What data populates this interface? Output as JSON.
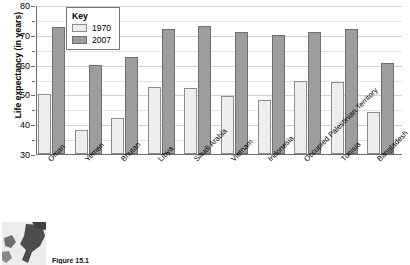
{
  "chart_data": {
    "type": "bar",
    "title": "",
    "xlabel": "",
    "ylabel": "Life expectancy (in years)",
    "ylim": [
      30,
      80
    ],
    "ytick_labels": [
      "30",
      "40",
      "50",
      "60",
      "70",
      "80"
    ],
    "yticks": [
      30,
      40,
      50,
      60,
      70,
      80
    ],
    "minor_ticks": [
      35,
      45,
      55,
      65,
      75
    ],
    "grid": true,
    "legend_position": "top-left-inside",
    "legend_title": "Key",
    "categories": [
      "Oman",
      "Yemen",
      "Bhutan",
      "Libya",
      "Saudi Arabia",
      "Vietnam",
      "Indonesia",
      "Occupied Palestinian Territory",
      "Tunisia",
      "Bangladesh"
    ],
    "series": [
      {
        "name": "1970",
        "color": "#eeeeee",
        "values": [
          50,
          38,
          42,
          52.5,
          52,
          49.5,
          48,
          54.5,
          54,
          44
        ]
      },
      {
        "name": "2007",
        "color": "#9d9d9d",
        "values": [
          72.5,
          60,
          62.5,
          72,
          73,
          71,
          70,
          71,
          72,
          60.5
        ]
      }
    ]
  },
  "figure": {
    "caption": "Figure 15.1"
  },
  "thumbnail": {
    "name": "world-map-thumbnail"
  }
}
